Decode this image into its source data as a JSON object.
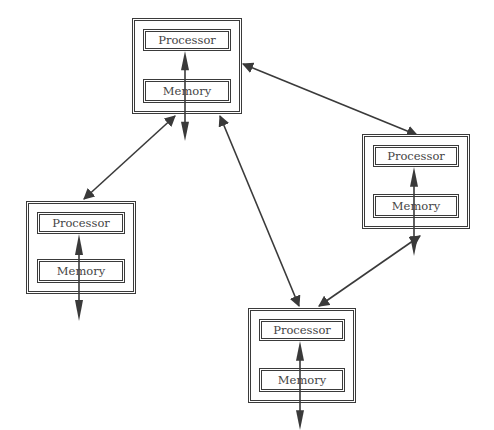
{
  "diagram": {
    "type": "distributed-memory-network",
    "nodes": [
      {
        "id": "n1",
        "processor_label": "Processor",
        "memory_label": "Memory",
        "x": 132,
        "y": 18,
        "w": 110,
        "h": 96
      },
      {
        "id": "n2",
        "processor_label": "Processor",
        "memory_label": "Memory",
        "x": 26,
        "y": 201,
        "w": 110,
        "h": 93
      },
      {
        "id": "n3",
        "processor_label": "Processor",
        "memory_label": "Memory",
        "x": 362,
        "y": 134,
        "w": 108,
        "h": 95
      },
      {
        "id": "n4",
        "processor_label": "Processor",
        "memory_label": "Memory",
        "x": 248,
        "y": 308,
        "w": 108,
        "h": 95
      }
    ],
    "edges": [
      {
        "from": "n1",
        "to": "n2",
        "x1": 175,
        "y1": 116,
        "x2": 84,
        "y2": 199,
        "bidirectional": true
      },
      {
        "from": "n1",
        "to": "n3",
        "x1": 243,
        "y1": 64,
        "x2": 417,
        "y2": 135,
        "bidirectional": true
      },
      {
        "from": "n1",
        "to": "n4",
        "x1": 220,
        "y1": 116,
        "x2": 299,
        "y2": 306,
        "bidirectional": true
      },
      {
        "from": "n3",
        "to": "n4",
        "x1": 420,
        "y1": 236,
        "x2": 319,
        "y2": 306,
        "bidirectional": true
      }
    ],
    "colors": {
      "line": "#3a3a3a",
      "text": "#444444",
      "background": "#ffffff"
    }
  }
}
